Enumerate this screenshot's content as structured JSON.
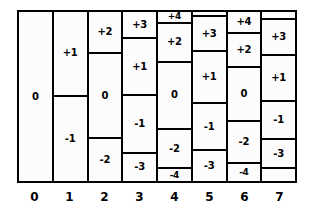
{
  "colors": {
    "ink": "#000000",
    "paper": "#ffffff",
    "cell_fill": "#fcfcfc"
  },
  "chart_data": {
    "type": "bar",
    "title": "",
    "xlabel": "",
    "ylabel": "",
    "grid": false,
    "legend": null,
    "categories": [
      "0",
      "1",
      "2",
      "3",
      "4",
      "5",
      "6",
      "7"
    ],
    "values": [
      1,
      2,
      3,
      4,
      5,
      4,
      5,
      4
    ],
    "ylim": [
      0,
      1
    ],
    "note": "Each category column is subdivided into cells labelled with signed integer levels; cell heights are the fraction of the column occupied.",
    "columns": [
      {
        "index": 0,
        "axis_label": "0",
        "cell_count": 1,
        "cells": [
          {
            "label": "0",
            "value": 0,
            "height": 1.0
          }
        ]
      },
      {
        "index": 1,
        "axis_label": "1",
        "cell_count": 2,
        "cells": [
          {
            "label": "+1",
            "value": 1,
            "height": 0.5
          },
          {
            "label": "-1",
            "value": -1,
            "height": 0.5
          }
        ]
      },
      {
        "index": 2,
        "axis_label": "2",
        "cell_count": 3,
        "cells": [
          {
            "label": "+2",
            "value": 2,
            "height": 0.25
          },
          {
            "label": "0",
            "value": 0,
            "height": 0.5
          },
          {
            "label": "-2",
            "value": -2,
            "height": 0.25
          }
        ]
      },
      {
        "index": 3,
        "axis_label": "3",
        "cell_count": 4,
        "cells": [
          {
            "label": "+3",
            "value": 3,
            "height": 0.16
          },
          {
            "label": "+1",
            "value": 1,
            "height": 0.34
          },
          {
            "label": "-1",
            "value": -1,
            "height": 0.34
          },
          {
            "label": "-3",
            "value": -3,
            "height": 0.16
          }
        ]
      },
      {
        "index": 4,
        "axis_label": "4",
        "cell_count": 5,
        "cells": [
          {
            "label": "+4",
            "value": 4,
            "height": 0.07
          },
          {
            "label": "+2",
            "value": 2,
            "height": 0.23
          },
          {
            "label": "0",
            "value": 0,
            "height": 0.4
          },
          {
            "label": "-2",
            "value": -2,
            "height": 0.23
          },
          {
            "label": "-4",
            "value": -4,
            "height": 0.07
          }
        ]
      },
      {
        "index": 5,
        "axis_label": "5",
        "cell_count": 5,
        "cells": [
          {
            "label": "",
            "value": null,
            "height": 0.03
          },
          {
            "label": "+3",
            "value": 3,
            "height": 0.2
          },
          {
            "label": "+1",
            "value": 1,
            "height": 0.3
          },
          {
            "label": "-1",
            "value": -1,
            "height": 0.27
          },
          {
            "label": "-3",
            "value": -3,
            "height": 0.17
          }
        ]
      },
      {
        "index": 6,
        "axis_label": "6",
        "cell_count": 5,
        "cells": [
          {
            "label": "+4",
            "value": 4,
            "height": 0.13
          },
          {
            "label": "+2",
            "value": 2,
            "height": 0.2
          },
          {
            "label": "0",
            "value": 0,
            "height": 0.32
          },
          {
            "label": "-2",
            "value": -2,
            "height": 0.25
          },
          {
            "label": "-4",
            "value": -4,
            "height": 0.1
          }
        ]
      },
      {
        "index": 7,
        "axis_label": "7",
        "cell_count": 6,
        "cells": [
          {
            "label": "",
            "value": null,
            "height": 0.05
          },
          {
            "label": "+3",
            "value": 3,
            "height": 0.21
          },
          {
            "label": "+1",
            "value": 1,
            "height": 0.27
          },
          {
            "label": "-1",
            "value": -1,
            "height": 0.23
          },
          {
            "label": "-3",
            "value": -3,
            "height": 0.17
          },
          {
            "label": "",
            "value": null,
            "height": 0.07
          }
        ]
      }
    ]
  },
  "axis": {
    "ticks": [
      "0",
      "1",
      "2",
      "3",
      "4",
      "5",
      "6",
      "7"
    ]
  }
}
